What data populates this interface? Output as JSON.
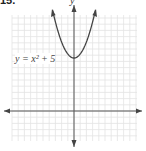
{
  "problem_label": "15.",
  "chart_data": {
    "type": "line",
    "title": "",
    "equation": "y = x² + 5",
    "xlabel": "",
    "ylabel": "y",
    "function": "x^2 + 5",
    "vertex": [
      0,
      5
    ],
    "grid": true,
    "axes_arrows": true
  }
}
